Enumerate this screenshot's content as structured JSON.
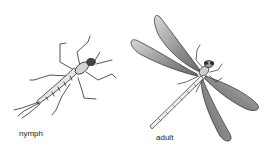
{
  "illustration": {
    "subject": "damselfly life stages",
    "figures": [
      {
        "id": "nymph",
        "label": "nymph"
      },
      {
        "id": "adult",
        "label": "adult"
      }
    ]
  },
  "colors": {
    "background": "#ffffff",
    "ink": "#222222",
    "wing_shade": "#8a8a8a"
  }
}
